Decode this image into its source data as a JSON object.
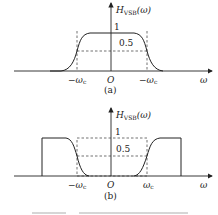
{
  "figure": {
    "panel_a": {
      "y_label_main": "H",
      "y_label_sub": "VSB",
      "y_label_arg": "(ω)",
      "x_label": "ω",
      "level_1": "1",
      "level_half": "0.5",
      "tick_left": "−ω",
      "tick_left_sub": "c",
      "origin": "O",
      "tick_right": "−ω",
      "tick_right_sub": "c",
      "caption": "(a)"
    },
    "panel_b": {
      "y_label_main": "H",
      "y_label_sub": "VSB",
      "y_label_arg": "(ω)",
      "x_label": "ω",
      "level_1": "1",
      "level_half": "0.5",
      "tick_left": "−ω",
      "tick_left_sub": "c",
      "origin": "O",
      "tick_right": "ω",
      "tick_right_sub": "c",
      "caption": "(b)"
    }
  }
}
